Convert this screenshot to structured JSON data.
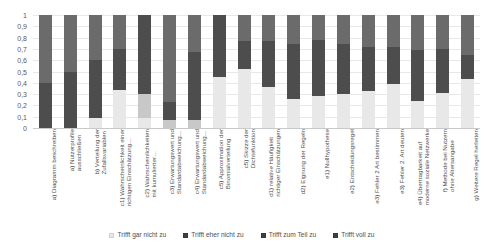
{
  "chart_data": {
    "type": "bar",
    "subtype": "stacked-bar-100-percent",
    "title": "",
    "xlabel": "",
    "ylabel": "",
    "ylim": [
      0,
      1
    ],
    "grid": true,
    "legend_position": "bottom",
    "ytick_labels": [
      "1",
      "0,9",
      "0,8",
      "0,7",
      "0,6",
      "0,5",
      "0,4",
      "0,3",
      "0,2",
      "0,1",
      "0"
    ],
    "ytick_values": [
      1,
      0.9,
      0.8,
      0.7,
      0.6,
      0.5,
      0.4,
      0.3,
      0.2,
      0.1,
      0
    ],
    "categories": [
      "a) Diagramm beschreiben",
      "a) Nutzerprofile\nausschließen",
      "b) Verteilung der\nZufallsvariablen",
      "c1) Wahrscheinlichkeit einer\nrichtigen Einschätzung…",
      "c2) Wahrscheinlichkeiten\nmit kumulierter…",
      "c3) Erwartungswert und\nStandardabweichung…",
      "c4) Erwartungswert und\nStandardabweichung…",
      "c5) Approximation der\nBinomialverteilung",
      "c5) Skizze der\nDichtefunktion",
      "d1) relative Häufigkeit\nrichtiger Einschätzungen",
      "d2) Eignung der Regeln",
      "e1) Nullhypothese",
      "e2) Entscheidungsregel",
      "e3) Fehler 2 Art bestimmen",
      "e3) Fehler 2. Art deuten",
      "e4) Übertragbarkeit auf\nmoderne soziale Netzwerke",
      "f) Methode bei Nutzern\nohne Altersangabe",
      "g) Weitere Regel herleiten"
    ],
    "series": [
      {
        "name": "Trifft gar nicht zu",
        "color": "#e8e8e8",
        "values": [
          0.0,
          0.0,
          0.09,
          0.34,
          0.09,
          0.0,
          0.0,
          0.45,
          0.52,
          0.36,
          0.26,
          0.28,
          0.3,
          0.33,
          0.39,
          0.24,
          0.31,
          0.43
        ]
      },
      {
        "name": "Trifft eher nicht zu",
        "color": "#c8c8c8",
        "values": [
          0.0,
          0.0,
          0.0,
          0.0,
          0.21,
          0.07,
          0.07,
          0.0,
          0.0,
          0.0,
          0.0,
          0.0,
          0.0,
          0.0,
          0.0,
          0.0,
          0.0,
          0.0
        ]
      },
      {
        "name": "Trifft zum Teil zu",
        "color": "#4d4d4d",
        "values": [
          0.4,
          0.5,
          0.51,
          0.36,
          0.7,
          0.16,
          0.6,
          0.55,
          0.25,
          0.41,
          0.48,
          0.5,
          0.44,
          0.39,
          0.33,
          0.45,
          0.39,
          0.22
        ]
      },
      {
        "name": "Trifft voll zu",
        "color": "#6b6b6b",
        "values": [
          0.6,
          0.5,
          0.4,
          0.3,
          0.0,
          0.77,
          0.33,
          0.0,
          0.23,
          0.23,
          0.26,
          0.22,
          0.26,
          0.28,
          0.28,
          0.31,
          0.3,
          0.35
        ]
      }
    ]
  },
  "legend": {
    "items": [
      {
        "label": "Trifft gar nicht zu",
        "color": "#e8e8e8"
      },
      {
        "label": "Trifft eher nicht zu",
        "color": "#3f3f3f"
      },
      {
        "label": "Trifft zum Teil zu",
        "color": "#3f3f3f"
      },
      {
        "label": "Trifft voll zu",
        "color": "#3f3f3f"
      }
    ]
  }
}
